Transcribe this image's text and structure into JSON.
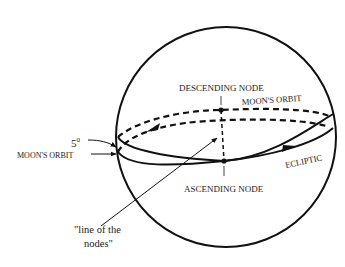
{
  "diagram": {
    "labels": {
      "descending_node": "DESCENDING NODE",
      "ascending_node": "ASCENDING NODE",
      "moons_orbit_top": "MOON'S ORBIT",
      "moons_orbit_left": "MOON'S ORBIT",
      "ecliptic": "ECLIPTIC",
      "inclination": "5",
      "inclination_unit": "0",
      "line_of_nodes_line1": "\"line of the",
      "line_of_nodes_line2": "nodes\""
    },
    "colors": {
      "stroke": "#111111",
      "text": "#222222",
      "background": "#ffffff"
    }
  }
}
